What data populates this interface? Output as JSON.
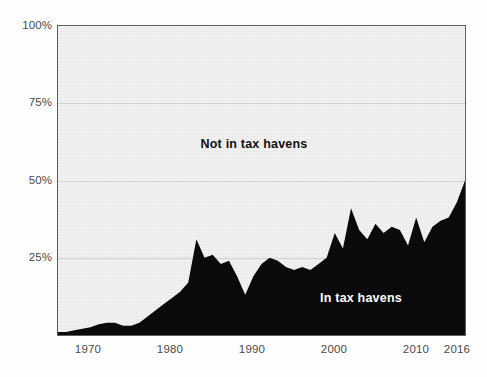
{
  "chart_data": {
    "type": "area",
    "title": "",
    "subtitle": "",
    "xlabel": "",
    "ylabel": "",
    "xlim": [
      1966,
      2016
    ],
    "ylim": [
      0,
      100
    ],
    "grid": true,
    "grid_axis": "y",
    "legend_position": "inline-annotations",
    "stacked": true,
    "y_tick_labels": [
      "100%",
      "75%",
      "50%",
      "25%"
    ],
    "y_tick_values": [
      100,
      75,
      50,
      25
    ],
    "x_tick_labels": [
      "1970",
      "1980",
      "1990",
      "2000",
      "2010",
      "2016"
    ],
    "x_tick_values": [
      1970,
      1980,
      1990,
      2000,
      2010,
      2016
    ],
    "series": [
      {
        "name": "Not in tax havens",
        "color": "#f2f2f2",
        "label_color": "#111111",
        "label_x": 1990,
        "label_y": 62
      },
      {
        "name": "In tax havens",
        "color": "#0a0a0a",
        "label_color": "#ffffff",
        "label_x": 2003,
        "label_y": 13
      }
    ],
    "x": [
      1966,
      1967,
      1968,
      1969,
      1970,
      1971,
      1972,
      1973,
      1974,
      1975,
      1976,
      1977,
      1978,
      1979,
      1980,
      1981,
      1982,
      1983,
      1984,
      1985,
      1986,
      1987,
      1988,
      1989,
      1990,
      1991,
      1992,
      1993,
      1994,
      1995,
      1996,
      1997,
      1998,
      1999,
      2000,
      2001,
      2002,
      2003,
      2004,
      2005,
      2006,
      2007,
      2008,
      2009,
      2010,
      2011,
      2012,
      2013,
      2014,
      2015,
      2016
    ],
    "values_in_tax_havens": [
      1,
      1,
      1.5,
      2,
      2.5,
      3.5,
      4,
      4,
      3,
      3,
      4,
      6,
      8,
      10,
      12,
      14,
      17,
      31,
      25,
      26,
      23,
      24,
      19,
      13,
      19,
      23,
      25,
      24,
      22,
      21,
      22,
      21,
      23,
      25,
      33,
      28,
      41,
      34,
      31,
      36,
      33,
      35,
      34,
      29,
      38,
      30,
      35,
      37,
      38,
      43,
      50
    ],
    "values_not_in_tax_havens": [
      99,
      99,
      98.5,
      98,
      97.5,
      96.5,
      96,
      96,
      97,
      97,
      96,
      94,
      92,
      90,
      88,
      86,
      83,
      69,
      75,
      74,
      77,
      76,
      81,
      87,
      81,
      77,
      75,
      76,
      78,
      79,
      78,
      79,
      77,
      75,
      67,
      72,
      59,
      66,
      69,
      64,
      67,
      65,
      66,
      71,
      62,
      70,
      65,
      63,
      62,
      57,
      50
    ],
    "annotations": [
      {
        "text": "Not in tax havens",
        "x": 1990,
        "y": 62
      },
      {
        "text": "In tax havens",
        "x": 2003,
        "y": 13
      }
    ]
  },
  "axes": {
    "y_ticks": [
      {
        "label": "100%",
        "value": 100
      },
      {
        "label": "75%",
        "value": 75
      },
      {
        "label": "50%",
        "value": 50
      },
      {
        "label": "25%",
        "value": 25
      }
    ],
    "x_ticks": [
      {
        "label": "1970",
        "value": 1970
      },
      {
        "label": "1980",
        "value": 1980
      },
      {
        "label": "1990",
        "value": 1990
      },
      {
        "label": "2000",
        "value": 2000
      },
      {
        "label": "2010",
        "value": 2010
      },
      {
        "label": "2016",
        "value": 2016
      }
    ]
  },
  "colors": {
    "area_in_tax_havens": "#0a0a0a",
    "area_not_in_tax_havens": "#f2f2f2",
    "gridline": "#d2d2d2",
    "axis_border": "#5d5d5d",
    "tick_text": "#4a4a4a",
    "page_background": "#fefefe"
  }
}
